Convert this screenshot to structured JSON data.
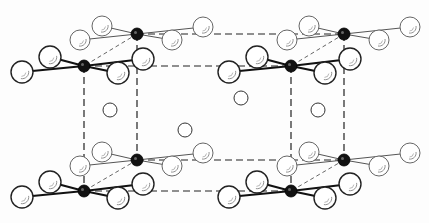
{
  "diagram": {
    "type": "crystal-structure",
    "colors": {
      "line": "#222222",
      "light_line": "#555555",
      "metal": "#111111",
      "background": "#fdfdfd"
    },
    "unit_cell": {
      "back": {
        "x1": 137,
        "y1": 34,
        "x2": 344,
        "y2": 160
      },
      "front": {
        "x1": 84,
        "y1": 66,
        "x2": 291,
        "y2": 191
      }
    },
    "metal_centers": [
      {
        "id": "back-top-left",
        "x": 137,
        "y": 34,
        "depth": "back"
      },
      {
        "id": "back-top-right",
        "x": 344,
        "y": 34,
        "depth": "back"
      },
      {
        "id": "front-top-left",
        "x": 84,
        "y": 66,
        "depth": "front"
      },
      {
        "id": "front-top-right",
        "x": 291,
        "y": 66,
        "depth": "front"
      },
      {
        "id": "back-bottom-left",
        "x": 137,
        "y": 160,
        "depth": "back"
      },
      {
        "id": "back-bottom-right",
        "x": 344,
        "y": 160,
        "depth": "back"
      },
      {
        "id": "front-bottom-left",
        "x": 84,
        "y": 191,
        "depth": "front"
      },
      {
        "id": "front-bottom-right",
        "x": 291,
        "y": 191,
        "depth": "front"
      }
    ],
    "ligand_offsets": {
      "back": [
        [
          -35,
          -8
        ],
        [
          -57,
          6
        ],
        [
          35,
          6
        ],
        [
          66,
          -7
        ]
      ],
      "front": [
        [
          -62,
          6
        ],
        [
          -34,
          -9
        ],
        [
          34,
          7
        ],
        [
          59,
          -7
        ]
      ]
    },
    "interstitial_atoms": [
      {
        "x": 110,
        "y": 110
      },
      {
        "x": 185,
        "y": 130
      },
      {
        "x": 241,
        "y": 98
      },
      {
        "x": 318,
        "y": 110
      }
    ]
  }
}
